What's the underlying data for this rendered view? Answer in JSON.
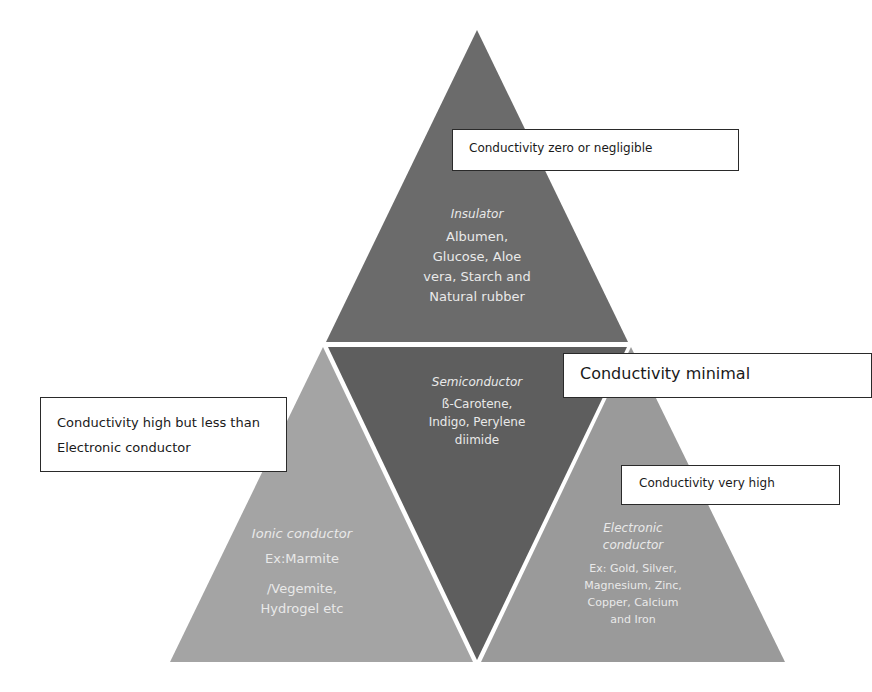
{
  "diagram": {
    "colors": {
      "insulator": "#6b6b6b",
      "semiconductor": "#5e5e5e",
      "ionic_conductor": "#a4a4a4",
      "electronic_conductor": "#9a9a9a",
      "separator": "#ffffff",
      "text_on_triangle": "#e9e9e9",
      "callout_border": "#2a2a2a"
    },
    "triangles": {
      "insulator": {
        "title": "Insulator",
        "body_lines": [
          "Albumen,",
          "Glucose, Aloe",
          "vera, Starch and",
          "Natural rubber"
        ]
      },
      "semiconductor": {
        "title": "Semiconductor",
        "body_lines": [
          "ß-Carotene,",
          "Indigo, Perylene",
          "diimide"
        ]
      },
      "ionic_conductor": {
        "title": "Ionic conductor",
        "body_lines": [
          "Ex:Marmite",
          "/Vegemite,",
          "Hydrogel  etc"
        ]
      },
      "electronic_conductor": {
        "title_lines": [
          "Electronic",
          "conductor"
        ],
        "body_lines": [
          "Ex: Gold, Silver,",
          "Magnesium, Zinc,",
          "Copper, Calcium",
          "and Iron"
        ]
      }
    },
    "callouts": {
      "insulator": "Conductivity zero or negligible",
      "semiconductor": "Conductivity minimal",
      "ionic_lines": [
        "Conductivity high but less than",
        "Electronic conductor"
      ],
      "electronic": "Conductivity very high"
    }
  }
}
